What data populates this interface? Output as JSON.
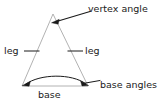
{
  "figure": {
    "name": "isosceles-triangle-parts-diagram",
    "background_color": "#ffffff",
    "shape_stroke_color": "#a8a8a8",
    "annotation_color": "#1a1a1a",
    "text_color": "#1a1a1a"
  },
  "labels": {
    "vertex_angle": "vertex angle",
    "leg_left": "leg",
    "leg_right": "leg",
    "base_angles": "base angles",
    "base": "base"
  },
  "geometry": {
    "apex": [
      53,
      14
    ],
    "base_left": [
      22,
      86
    ],
    "base_right": [
      88,
      86
    ]
  },
  "annotations": [
    {
      "name": "vertex-angle-leader",
      "type": "arrow",
      "label": "vertex angle",
      "from": [
        90,
        12
      ],
      "to": [
        54,
        22
      ]
    },
    {
      "name": "leg-left-leader",
      "type": "line",
      "label": "leg",
      "from": [
        24,
        51
      ],
      "to": [
        39,
        51
      ]
    },
    {
      "name": "leg-right-leader",
      "type": "line",
      "label": "leg",
      "from": [
        68,
        51
      ],
      "to": [
        83,
        51
      ]
    },
    {
      "name": "base-angles-leader",
      "type": "double-arrow-curve",
      "label": "base angles",
      "from": [
        24,
        84
      ],
      "to": [
        86,
        84
      ],
      "tail_to": [
        100,
        83
      ]
    }
  ]
}
